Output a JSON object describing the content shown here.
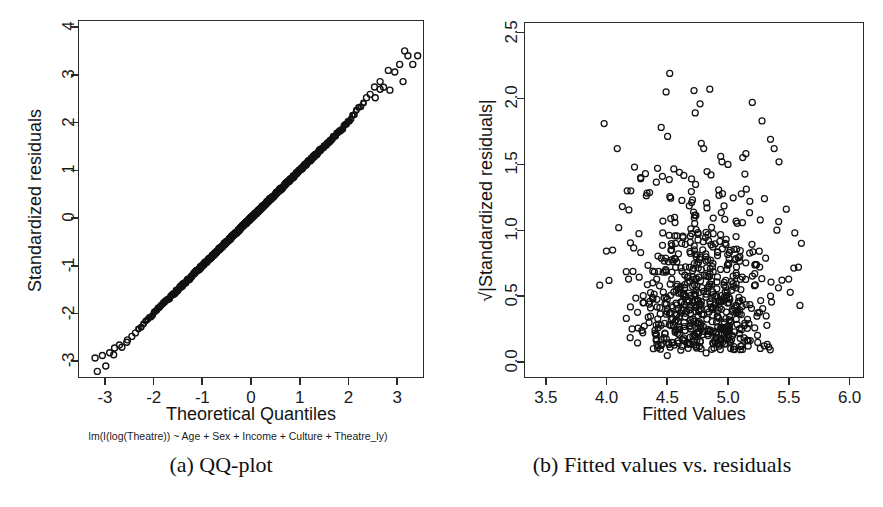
{
  "figure": {
    "panels": [
      {
        "key": "a",
        "caption": "(a) QQ-plot",
        "subtitle": "lm(I(log(Theatre)) ~ Age + Sex + Income + Culture + Theatre_ly)",
        "xlabel": "Theoretical Quantiles",
        "ylabel": "Standardized residuals"
      },
      {
        "key": "b",
        "caption": "(b) Fitted values vs. residuals",
        "xlabel": "Fitted Values",
        "ylabel": "√|Standardized residuals|"
      }
    ]
  },
  "chart_data": [
    {
      "type": "scatter",
      "id": "qq-plot",
      "title": "",
      "subtitle": "lm(I(log(Theatre)) ~ Age + Sex + Income + Culture + Theatre_ly)",
      "xlabel": "Theoretical Quantiles",
      "ylabel": "Standardized residuals",
      "xlim": [
        -3.55,
        3.55
      ],
      "ylim": [
        -3.35,
        4.15
      ],
      "xticks": [
        -3,
        -2,
        -1,
        0,
        1,
        2,
        3
      ],
      "xticklabels": [
        "-3",
        "-2",
        "-1",
        "0",
        "1",
        "2",
        "3"
      ],
      "yticks": [
        -3,
        -2,
        -1,
        0,
        1,
        2,
        3,
        4
      ],
      "yticklabels": [
        "-3",
        "-2",
        "-1",
        "0",
        "1",
        "2",
        "3",
        "4"
      ],
      "grid": false,
      "legend": null,
      "marker": "open-circle",
      "n_points": 620,
      "description": "Points follow the 1:1 reference line closely from about (-2.9,-2.9) to (2.6,2.6); mild heavy right tail with isolated points rising to about 3.4 near theoretical quantile 3.3, and a short low tail near -3.",
      "reference_line": {
        "slope": 1.0,
        "intercept": 0.0,
        "drawn": false
      },
      "sample_points": [
        [
          -3.2,
          -2.93
        ],
        [
          -3.05,
          -2.88
        ],
        [
          -2.98,
          -3.1
        ],
        [
          -2.9,
          -2.82
        ],
        [
          -2.8,
          -2.72
        ],
        [
          -2.7,
          -2.66
        ],
        [
          -2.55,
          -2.6
        ],
        [
          -2.45,
          -2.52
        ],
        [
          -2.3,
          -2.42
        ],
        [
          -2.15,
          -2.25
        ],
        [
          -2.05,
          -2.12
        ],
        [
          -1.95,
          -2.0
        ],
        [
          -1.8,
          -1.88
        ],
        [
          -1.6,
          -1.66
        ],
        [
          -1.4,
          -1.45
        ],
        [
          -1.2,
          -1.22
        ],
        [
          -1.0,
          -1.02
        ],
        [
          -0.8,
          -0.82
        ],
        [
          -0.6,
          -0.6
        ],
        [
          -0.4,
          -0.4
        ],
        [
          -0.2,
          -0.2
        ],
        [
          0.0,
          0.0
        ],
        [
          0.2,
          0.2
        ],
        [
          0.4,
          0.4
        ],
        [
          0.6,
          0.6
        ],
        [
          0.8,
          0.82
        ],
        [
          1.0,
          1.02
        ],
        [
          1.2,
          1.22
        ],
        [
          1.4,
          1.44
        ],
        [
          1.6,
          1.66
        ],
        [
          1.8,
          1.86
        ],
        [
          2.0,
          2.06
        ],
        [
          2.2,
          2.24
        ],
        [
          2.4,
          2.42
        ],
        [
          2.55,
          2.52
        ],
        [
          2.65,
          2.7
        ],
        [
          2.72,
          2.74
        ],
        [
          2.85,
          2.68
        ],
        [
          2.95,
          3.06
        ],
        [
          3.05,
          3.22
        ],
        [
          3.12,
          2.86
        ],
        [
          3.22,
          3.4
        ],
        [
          3.32,
          3.22
        ],
        [
          3.42,
          3.4
        ]
      ]
    },
    {
      "type": "scatter",
      "id": "scale-location",
      "title": "",
      "xlabel": "Fitted Values",
      "ylabel": "√|Standardized residuals|",
      "xlim": [
        3.32,
        6.12
      ],
      "ylim": [
        -0.12,
        2.58
      ],
      "xticks": [
        3.5,
        4.0,
        4.5,
        5.0,
        5.5,
        6.0
      ],
      "xticklabels": [
        "3.5",
        "4.0",
        "4.5",
        "5.0",
        "5.5",
        "6.0"
      ],
      "yticks": [
        0.0,
        0.5,
        1.0,
        1.5,
        2.0,
        2.5
      ],
      "yticklabels": [
        "0.0",
        "0.5",
        "1.0",
        "1.5",
        "2.0",
        "2.5"
      ],
      "grid": false,
      "legend": null,
      "marker": "open-circle",
      "n_points": 620,
      "description": "Dense blob of open circles centred near fitted value 4.8 and sqrt|std. resid.| 0.85; spread of fitted values roughly 4.0 to 5.8, vertical spread roughly 0.05 to 1.6 with scattered high outliers up to 2.2.",
      "cluster_center": [
        4.8,
        0.85
      ],
      "x_spread": [
        4.0,
        5.8
      ],
      "y_spread": [
        0.05,
        1.6
      ],
      "sample_points": [
        [
          3.98,
          1.81
        ],
        [
          4.52,
          2.19
        ],
        [
          4.49,
          2.05
        ],
        [
          4.72,
          2.06
        ],
        [
          4.85,
          2.07
        ],
        [
          4.77,
          1.96
        ],
        [
          5.2,
          1.97
        ],
        [
          4.73,
          1.89
        ],
        [
          5.28,
          1.83
        ],
        [
          4.45,
          1.78
        ],
        [
          4.78,
          1.66
        ],
        [
          4.8,
          1.62
        ],
        [
          5.35,
          1.69
        ],
        [
          4.94,
          1.56
        ],
        [
          5.38,
          1.62
        ],
        [
          4.23,
          1.48
        ],
        [
          4.32,
          1.43
        ],
        [
          4.42,
          1.47
        ],
        [
          4.95,
          1.52
        ],
        [
          5.0,
          1.5
        ],
        [
          5.42,
          1.52
        ],
        [
          4.28,
          1.4
        ],
        [
          4.46,
          1.41
        ],
        [
          4.6,
          1.44
        ],
        [
          4.7,
          1.39
        ],
        [
          4.86,
          1.42
        ],
        [
          4.17,
          1.3
        ],
        [
          4.2,
          1.3
        ],
        [
          4.13,
          1.18
        ],
        [
          4.1,
          1.02
        ],
        [
          5.48,
          1.16
        ],
        [
          5.3,
          1.24
        ],
        [
          5.18,
          1.22
        ],
        [
          5.55,
          0.98
        ],
        [
          5.58,
          0.72
        ],
        [
          5.5,
          0.63
        ],
        [
          4.05,
          0.85
        ],
        [
          4.02,
          0.62
        ],
        [
          4.3,
          0.45
        ],
        [
          4.35,
          0.3
        ],
        [
          4.48,
          0.22
        ],
        [
          4.5,
          0.05
        ],
        [
          4.82,
          0.07
        ],
        [
          5.02,
          0.3
        ],
        [
          5.22,
          0.26
        ],
        [
          5.32,
          0.28
        ],
        [
          4.62,
          0.12
        ],
        [
          4.9,
          0.18
        ]
      ]
    }
  ]
}
